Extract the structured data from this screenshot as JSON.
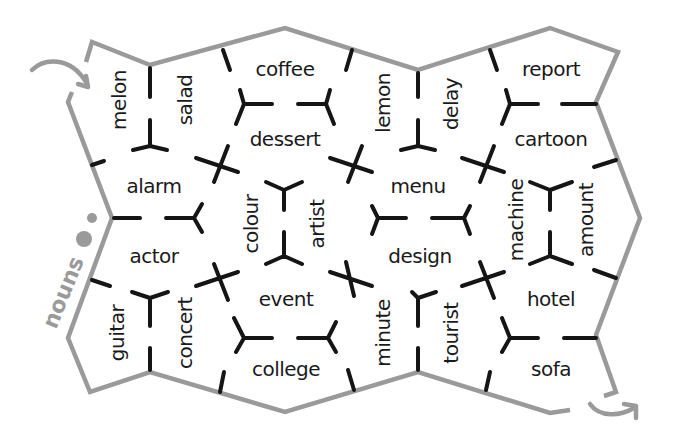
{
  "title": "nouns",
  "colors": {
    "outline": "#9a9a9a",
    "cut_marks": "#151515",
    "text": "#1a1a1a",
    "background": "#ffffff"
  },
  "label": {
    "text": "nouns",
    "x": 55,
    "y": 330,
    "rotate": -68
  },
  "dots": [
    {
      "cx": 84,
      "cy": 239,
      "r": 8
    },
    {
      "cx": 92,
      "cy": 218,
      "r": 5
    }
  ],
  "tiles": [
    {
      "id": "melon",
      "text": "melon",
      "x": 120,
      "y": 100,
      "rotate": -90
    },
    {
      "id": "salad",
      "text": "salad",
      "x": 186,
      "y": 100,
      "rotate": -90
    },
    {
      "id": "coffee",
      "text": "coffee",
      "x": 285,
      "y": 76,
      "rotate": 0
    },
    {
      "id": "dessert",
      "text": "dessert",
      "x": 285,
      "y": 146,
      "rotate": 0
    },
    {
      "id": "lemon",
      "text": "lemon",
      "x": 384,
      "y": 100,
      "rotate": -90
    },
    {
      "id": "delay",
      "text": "delay",
      "x": 452,
      "y": 100,
      "rotate": -90
    },
    {
      "id": "report",
      "text": "report",
      "x": 551,
      "y": 76,
      "rotate": 0
    },
    {
      "id": "cartoon",
      "text": "cartoon",
      "x": 551,
      "y": 146,
      "rotate": 0
    },
    {
      "id": "alarm",
      "text": "alarm",
      "x": 154,
      "y": 194,
      "rotate": 0
    },
    {
      "id": "colour",
      "text": "colour",
      "x": 252,
      "y": 226,
      "rotate": -90
    },
    {
      "id": "artist",
      "text": "artist",
      "x": 318,
      "y": 226,
      "rotate": -90
    },
    {
      "id": "menu",
      "text": "menu",
      "x": 418,
      "y": 194,
      "rotate": 0
    },
    {
      "id": "machine",
      "text": "machine",
      "x": 517,
      "y": 226,
      "rotate": -90
    },
    {
      "id": "amount",
      "text": "amount",
      "x": 585,
      "y": 226,
      "rotate": -90
    },
    {
      "id": "actor",
      "text": "actor",
      "x": 154,
      "y": 264,
      "rotate": 0
    },
    {
      "id": "design",
      "text": "design",
      "x": 418,
      "y": 264,
      "rotate": 0
    },
    {
      "id": "event",
      "text": "event",
      "x": 285,
      "y": 307,
      "rotate": 0
    },
    {
      "id": "hotel",
      "text": "hotel",
      "x": 551,
      "y": 307,
      "rotate": 0
    },
    {
      "id": "guitar",
      "text": "guitar",
      "x": 120,
      "y": 335,
      "rotate": -90
    },
    {
      "id": "concert",
      "text": "concert",
      "x": 186,
      "y": 335,
      "rotate": -90
    },
    {
      "id": "college",
      "text": "college",
      "x": 285,
      "y": 376,
      "rotate": 0
    },
    {
      "id": "minute",
      "text": "minute",
      "x": 384,
      "y": 335,
      "rotate": -90
    },
    {
      "id": "tourist",
      "text": "tourist",
      "x": 452,
      "y": 335,
      "rotate": -90
    },
    {
      "id": "sofa",
      "text": "sofa",
      "x": 551,
      "y": 376,
      "rotate": 0
    }
  ]
}
